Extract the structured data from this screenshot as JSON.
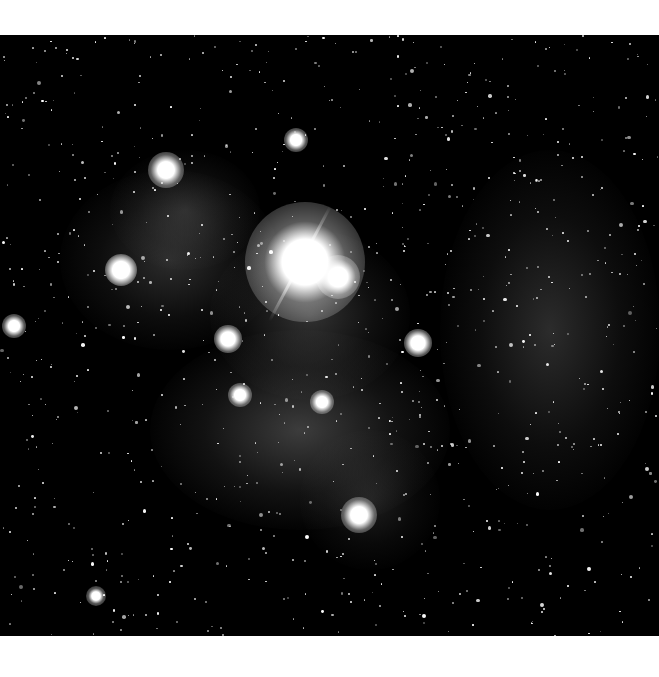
{
  "image": {
    "subject": "galaxy-star-field",
    "background_color": "#000000",
    "margin_color": "#ffffff",
    "nebulae": [
      {
        "x": 60,
        "y": 170,
        "w": 220,
        "h": 180,
        "a": 0.22
      },
      {
        "x": 150,
        "y": 330,
        "w": 300,
        "h": 200,
        "a": 0.3
      },
      {
        "x": 440,
        "y": 150,
        "w": 220,
        "h": 360,
        "a": 0.22
      },
      {
        "x": 210,
        "y": 230,
        "w": 200,
        "h": 170,
        "a": 0.25
      },
      {
        "x": 110,
        "y": 150,
        "w": 150,
        "h": 120,
        "a": 0.18
      },
      {
        "x": 300,
        "y": 430,
        "w": 140,
        "h": 140,
        "a": 0.15
      }
    ],
    "bright_stars": [
      {
        "x": 305,
        "y": 262,
        "r": 16,
        "glow": 60
      },
      {
        "x": 338,
        "y": 277,
        "r": 7,
        "glow": 22
      },
      {
        "x": 166,
        "y": 170,
        "r": 6,
        "glow": 18
      },
      {
        "x": 121,
        "y": 270,
        "r": 6,
        "glow": 16
      },
      {
        "x": 359,
        "y": 515,
        "r": 6,
        "glow": 18
      },
      {
        "x": 228,
        "y": 339,
        "r": 5,
        "glow": 14
      },
      {
        "x": 14,
        "y": 326,
        "r": 4,
        "glow": 12
      },
      {
        "x": 296,
        "y": 140,
        "r": 4,
        "glow": 12
      },
      {
        "x": 418,
        "y": 343,
        "r": 5,
        "glow": 14
      },
      {
        "x": 322,
        "y": 402,
        "r": 4,
        "glow": 12
      },
      {
        "x": 240,
        "y": 395,
        "r": 4,
        "glow": 12
      },
      {
        "x": 96,
        "y": 596,
        "r": 3,
        "glow": 10
      }
    ],
    "spike": {
      "x": 300,
      "y": 262,
      "length": 130,
      "angle": -62
    }
  }
}
